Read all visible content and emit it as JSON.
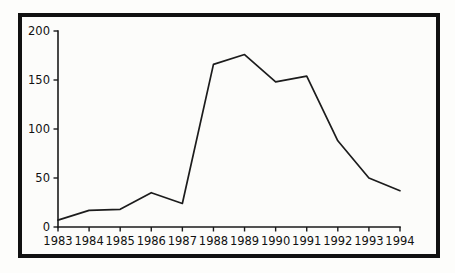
{
  "chart_data": {
    "type": "line",
    "title": "",
    "subtitle": "",
    "xlabel": "",
    "ylabel": "",
    "categories": [
      "1983",
      "1984",
      "1985",
      "1986",
      "1987",
      "1988",
      "1989",
      "1990",
      "1991",
      "1992",
      "1993",
      "1994"
    ],
    "values": [
      7,
      17,
      18,
      35,
      24,
      166,
      176,
      148,
      154,
      88,
      50,
      37
    ],
    "series": [
      {
        "name": "",
        "values": [
          7,
          17,
          18,
          35,
          24,
          166,
          176,
          148,
          154,
          88,
          50,
          37
        ]
      }
    ],
    "ylim": [
      0,
      200
    ],
    "yticks": [
      0,
      50,
      100,
      150,
      200
    ],
    "ytick_labels": [
      "0",
      "50",
      "100",
      "150",
      "200"
    ],
    "xtick_labels": [
      "1983",
      "1984",
      "1985",
      "1986",
      "1987",
      "1988",
      "1989",
      "1990",
      "1991",
      "1992",
      "1993",
      "1994"
    ],
    "grid": false,
    "legend": false,
    "legend_position": "none",
    "annotations": [],
    "colors": {
      "line": "#1c1c1c",
      "axis": "#1a1a1a",
      "text": "#111111",
      "frame": "#111111",
      "background": "#fcfcfa"
    }
  },
  "figure": {
    "frame_label": "chart-frame",
    "plot_label": "line-plot-area"
  }
}
